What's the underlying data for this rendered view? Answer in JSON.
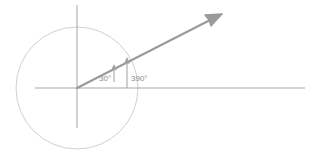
{
  "figure": {
    "name": "coterminal-angle-unit-circle-diagram",
    "background_color": "#ffffff",
    "width": 315,
    "height": 154,
    "colors": {
      "axis": "#a6a6a6",
      "circle": "#c9c9c9",
      "ray": "#9a9a9a",
      "indicator": "#a0a0a0",
      "label_text": "#8a8a8a"
    },
    "origin": {
      "x": 77,
      "y": 88
    },
    "circle": {
      "center_x": 77,
      "center_y": 88,
      "radius": 61
    },
    "x_axis": {
      "x1": 35,
      "y1": 88,
      "x2": 305,
      "y2": 88
    },
    "y_axis": {
      "x1": 77,
      "y1": 5,
      "x2": 77,
      "y2": 128
    },
    "ray": {
      "angle_degrees": 27,
      "x1": 77,
      "y1": 88,
      "x2": 222,
      "y2": 14,
      "arrowhead": "open-arrow-tip"
    },
    "labels": [
      {
        "id": "angle-30",
        "text": "30°",
        "x": 99,
        "y": 80,
        "indicator_base_x": 114,
        "indicator_base_y": 82,
        "indicator_tip_x": 114,
        "indicator_tip_y": 66
      },
      {
        "id": "angle-390",
        "text": "390°",
        "x": 131,
        "y": 80,
        "indicator_base_x": 127,
        "indicator_base_y": 88,
        "indicator_tip_x": 127,
        "indicator_tip_y": 59
      }
    ]
  }
}
